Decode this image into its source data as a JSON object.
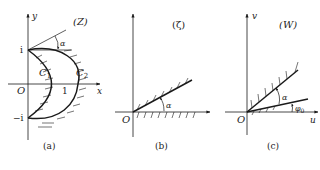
{
  "figure": {
    "panels": [
      {
        "id": "a",
        "caption": "(a)",
        "plane_label": "(Z)",
        "axes": {
          "x": "x",
          "y": "y",
          "origin": "O"
        },
        "tick_labels": {
          "top": "i",
          "bottom": "−i",
          "right": "1"
        },
        "curves": {
          "inner": "C",
          "inner_sub": "1",
          "outer": "C",
          "outer_sub": "2"
        },
        "angle_label": "α"
      },
      {
        "id": "b",
        "caption": "(b)",
        "plane_label": "(ζ)",
        "axes": {
          "origin": "O"
        },
        "angle_label": "α"
      },
      {
        "id": "c",
        "caption": "(c)",
        "plane_label": "(W)",
        "axes": {
          "x": "u",
          "y": "v",
          "origin": "O"
        },
        "angle_label": "α",
        "angle2_label": "φ",
        "angle2_sub": "0"
      }
    ]
  },
  "colors": {
    "line": "#1a1a1a",
    "background": "#ffffff"
  }
}
